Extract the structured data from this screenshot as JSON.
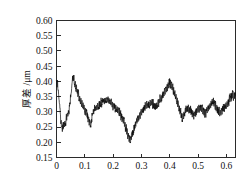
{
  "chart_data": {
    "type": "line",
    "title": "",
    "subtitle": "",
    "xlabel": "",
    "ylabel": "厚差 /μm",
    "xlim": [
      0,
      0.632
    ],
    "ylim": [
      0.15,
      0.6
    ],
    "grid": false,
    "legend": null,
    "legend_position": "none",
    "xticks": [
      0,
      0.1,
      0.2,
      0.3,
      0.4,
      0.5,
      0.6
    ],
    "xtick_labels": [
      "0",
      "0.1",
      "0.2",
      "0.3",
      "0.4",
      "0.5",
      "0.6"
    ],
    "yticks": [
      0.15,
      0.2,
      0.25,
      0.3,
      0.35,
      0.4,
      0.45,
      0.5,
      0.55,
      0.6
    ],
    "ytick_labels": [
      "0.15",
      "0.20",
      "0.25",
      "0.30",
      "0.35",
      "0.40",
      "0.45",
      "0.50",
      "0.55",
      "0.60"
    ],
    "series": [
      {
        "name": "thickness-deviation",
        "color": "#0d0d0d",
        "x": [
          0.0,
          0.002,
          0.004,
          0.006,
          0.008,
          0.01,
          0.012,
          0.014,
          0.016,
          0.018,
          0.02,
          0.022,
          0.024,
          0.026,
          0.028,
          0.03,
          0.032,
          0.034,
          0.036,
          0.038,
          0.04,
          0.042,
          0.044,
          0.046,
          0.048,
          0.05,
          0.052,
          0.054,
          0.056,
          0.058,
          0.06,
          0.062,
          0.064,
          0.066,
          0.068,
          0.07,
          0.072,
          0.074,
          0.076,
          0.078,
          0.08,
          0.082,
          0.084,
          0.086,
          0.088,
          0.09,
          0.092,
          0.094,
          0.096,
          0.098,
          0.1,
          0.102,
          0.104,
          0.106,
          0.108,
          0.11,
          0.112,
          0.114,
          0.116,
          0.118,
          0.12,
          0.122,
          0.124,
          0.126,
          0.128,
          0.13,
          0.132,
          0.134,
          0.136,
          0.138,
          0.14,
          0.142,
          0.144,
          0.146,
          0.148,
          0.15,
          0.152,
          0.154,
          0.156,
          0.158,
          0.16,
          0.162,
          0.164,
          0.166,
          0.168,
          0.17,
          0.172,
          0.174,
          0.176,
          0.178,
          0.18,
          0.182,
          0.184,
          0.186,
          0.188,
          0.19,
          0.192,
          0.194,
          0.196,
          0.198,
          0.2,
          0.202,
          0.204,
          0.206,
          0.208,
          0.21,
          0.212,
          0.214,
          0.216,
          0.218,
          0.22,
          0.222,
          0.224,
          0.226,
          0.228,
          0.23,
          0.232,
          0.234,
          0.236,
          0.238,
          0.24,
          0.242,
          0.244,
          0.246,
          0.248,
          0.25,
          0.252,
          0.254,
          0.256,
          0.258,
          0.26,
          0.262,
          0.264,
          0.266,
          0.268,
          0.27,
          0.272,
          0.274,
          0.276,
          0.278,
          0.28,
          0.282,
          0.284,
          0.286,
          0.288,
          0.29,
          0.292,
          0.294,
          0.296,
          0.298,
          0.3,
          0.302,
          0.304,
          0.306,
          0.308,
          0.31,
          0.312,
          0.314,
          0.316,
          0.318,
          0.32,
          0.322,
          0.324,
          0.326,
          0.328,
          0.33,
          0.332,
          0.334,
          0.336,
          0.338,
          0.34,
          0.342,
          0.344,
          0.346,
          0.348,
          0.35,
          0.352,
          0.354,
          0.356,
          0.358,
          0.36,
          0.362,
          0.364,
          0.366,
          0.368,
          0.37,
          0.372,
          0.374,
          0.376,
          0.378,
          0.38,
          0.382,
          0.384,
          0.386,
          0.388,
          0.39,
          0.392,
          0.394,
          0.396,
          0.398,
          0.4,
          0.402,
          0.404,
          0.406,
          0.408,
          0.41,
          0.412,
          0.414,
          0.416,
          0.418,
          0.42,
          0.422,
          0.424,
          0.426,
          0.428,
          0.43,
          0.432,
          0.434,
          0.436,
          0.438,
          0.44,
          0.442,
          0.444,
          0.446,
          0.448,
          0.45,
          0.452,
          0.454,
          0.456,
          0.458,
          0.46,
          0.462,
          0.464,
          0.466,
          0.468,
          0.47,
          0.472,
          0.474,
          0.476,
          0.478,
          0.48,
          0.482,
          0.484,
          0.486,
          0.488,
          0.49,
          0.492,
          0.494,
          0.496,
          0.498,
          0.5,
          0.502,
          0.504,
          0.506,
          0.508,
          0.51,
          0.512,
          0.514,
          0.516,
          0.518,
          0.52,
          0.522,
          0.524,
          0.526,
          0.528,
          0.53,
          0.532,
          0.534,
          0.536,
          0.538,
          0.54,
          0.542,
          0.544,
          0.546,
          0.548,
          0.55,
          0.552,
          0.554,
          0.556,
          0.558,
          0.56,
          0.562,
          0.564,
          0.566,
          0.568,
          0.57,
          0.572,
          0.574,
          0.576,
          0.578,
          0.58,
          0.582,
          0.584,
          0.586,
          0.588,
          0.59,
          0.592,
          0.594,
          0.596,
          0.598,
          0.6,
          0.602,
          0.604,
          0.606,
          0.608,
          0.61,
          0.612,
          0.614,
          0.616,
          0.618,
          0.62,
          0.622,
          0.624,
          0.626,
          0.628,
          0.63,
          0.632
        ],
        "y": [
          0.402,
          0.381,
          0.398,
          0.372,
          0.352,
          0.33,
          0.312,
          0.29,
          0.268,
          0.252,
          0.243,
          0.258,
          0.249,
          0.262,
          0.255,
          0.27,
          0.262,
          0.282,
          0.272,
          0.295,
          0.285,
          0.305,
          0.292,
          0.318,
          0.33,
          0.348,
          0.362,
          0.385,
          0.405,
          0.415,
          0.402,
          0.412,
          0.392,
          0.398,
          0.378,
          0.386,
          0.366,
          0.374,
          0.352,
          0.362,
          0.34,
          0.352,
          0.33,
          0.345,
          0.322,
          0.338,
          0.316,
          0.33,
          0.308,
          0.322,
          0.3,
          0.312,
          0.292,
          0.302,
          0.282,
          0.292,
          0.272,
          0.282,
          0.262,
          0.272,
          0.255,
          0.268,
          0.276,
          0.288,
          0.296,
          0.308,
          0.3,
          0.312,
          0.304,
          0.318,
          0.308,
          0.322,
          0.312,
          0.326,
          0.316,
          0.33,
          0.32,
          0.334,
          0.322,
          0.336,
          0.326,
          0.34,
          0.33,
          0.342,
          0.332,
          0.345,
          0.334,
          0.346,
          0.336,
          0.348,
          0.338,
          0.35,
          0.332,
          0.344,
          0.326,
          0.34,
          0.322,
          0.336,
          0.318,
          0.332,
          0.314,
          0.328,
          0.31,
          0.324,
          0.306,
          0.32,
          0.3,
          0.316,
          0.296,
          0.31,
          0.292,
          0.306,
          0.286,
          0.3,
          0.28,
          0.292,
          0.272,
          0.284,
          0.262,
          0.276,
          0.252,
          0.266,
          0.24,
          0.256,
          0.226,
          0.242,
          0.212,
          0.23,
          0.202,
          0.222,
          0.198,
          0.218,
          0.208,
          0.228,
          0.222,
          0.24,
          0.232,
          0.252,
          0.244,
          0.262,
          0.252,
          0.27,
          0.262,
          0.28,
          0.272,
          0.288,
          0.278,
          0.296,
          0.286,
          0.302,
          0.292,
          0.308,
          0.298,
          0.314,
          0.302,
          0.318,
          0.306,
          0.322,
          0.31,
          0.326,
          0.312,
          0.328,
          0.316,
          0.332,
          0.318,
          0.334,
          0.32,
          0.336,
          0.322,
          0.338,
          0.318,
          0.334,
          0.312,
          0.328,
          0.308,
          0.324,
          0.312,
          0.33,
          0.318,
          0.336,
          0.324,
          0.342,
          0.33,
          0.348,
          0.336,
          0.354,
          0.342,
          0.36,
          0.348,
          0.366,
          0.352,
          0.372,
          0.358,
          0.378,
          0.366,
          0.386,
          0.372,
          0.396,
          0.382,
          0.408,
          0.39,
          0.405,
          0.382,
          0.396,
          0.374,
          0.388,
          0.366,
          0.38,
          0.356,
          0.37,
          0.342,
          0.358,
          0.33,
          0.346,
          0.316,
          0.332,
          0.302,
          0.32,
          0.292,
          0.308,
          0.28,
          0.296,
          0.272,
          0.29,
          0.282,
          0.3,
          0.29,
          0.308,
          0.296,
          0.312,
          0.3,
          0.316,
          0.304,
          0.318,
          0.3,
          0.314,
          0.296,
          0.31,
          0.292,
          0.306,
          0.288,
          0.302,
          0.284,
          0.3,
          0.286,
          0.304,
          0.292,
          0.31,
          0.296,
          0.314,
          0.3,
          0.318,
          0.302,
          0.32,
          0.304,
          0.322,
          0.3,
          0.318,
          0.296,
          0.314,
          0.292,
          0.31,
          0.288,
          0.306,
          0.29,
          0.31,
          0.296,
          0.316,
          0.302,
          0.322,
          0.308,
          0.328,
          0.314,
          0.336,
          0.32,
          0.342,
          0.326,
          0.346,
          0.318,
          0.338,
          0.31,
          0.33,
          0.302,
          0.322,
          0.296,
          0.316,
          0.29,
          0.31,
          0.286,
          0.306,
          0.292,
          0.312,
          0.298,
          0.318,
          0.302,
          0.322,
          0.306,
          0.326,
          0.31,
          0.33,
          0.314,
          0.334,
          0.32,
          0.34,
          0.326,
          0.348,
          0.332,
          0.354,
          0.34,
          0.36,
          0.346,
          0.366,
          0.352,
          0.346,
          0.356,
          0.362,
          0.352
        ]
      }
    ]
  }
}
